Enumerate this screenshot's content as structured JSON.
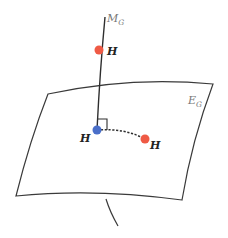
{
  "diagram": {
    "manifold_label": "M",
    "manifold_subscript": "G",
    "surface_label": "E",
    "surface_subscript": "G",
    "points": [
      {
        "id": "top",
        "label": "H",
        "color": "#ef5a45"
      },
      {
        "id": "foot",
        "label": "H",
        "color": "#4a6fc9"
      },
      {
        "id": "side",
        "label": "H",
        "color": "#ef5a45"
      }
    ],
    "colors": {
      "line": "#2e2e2e",
      "surface_stroke": "#3a3a3a",
      "label_gray": "#777777",
      "label_dark": "#222222"
    }
  }
}
